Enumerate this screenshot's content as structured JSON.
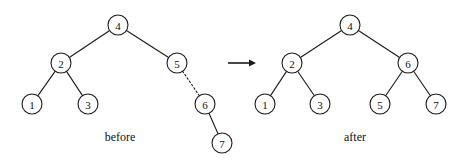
{
  "figure": {
    "background_color": "#ffffff",
    "stroke_color": "#1a1a1a",
    "node_fill": "#ffffff",
    "width": 467,
    "height": 163
  },
  "before": {
    "caption": "before",
    "caption_x": 120,
    "caption_y": 141,
    "nodes": [
      {
        "id": "b4",
        "label": "4",
        "x": 118,
        "y": 25,
        "r": 10
      },
      {
        "id": "b2",
        "label": "2",
        "x": 61,
        "y": 63,
        "r": 10
      },
      {
        "id": "b5",
        "label": "5",
        "x": 177,
        "y": 63,
        "r": 10
      },
      {
        "id": "b1",
        "label": "1",
        "x": 32,
        "y": 104,
        "r": 10
      },
      {
        "id": "b3",
        "label": "3",
        "x": 88,
        "y": 104,
        "r": 10
      },
      {
        "id": "b6",
        "label": "6",
        "x": 205,
        "y": 104,
        "r": 10
      },
      {
        "id": "b7",
        "label": "7",
        "x": 222,
        "y": 143,
        "r": 10
      }
    ],
    "edges": [
      {
        "from": "b4",
        "to": "b2",
        "style": "solid"
      },
      {
        "from": "b4",
        "to": "b5",
        "style": "solid"
      },
      {
        "from": "b2",
        "to": "b1",
        "style": "solid"
      },
      {
        "from": "b2",
        "to": "b3",
        "style": "solid"
      },
      {
        "from": "b5",
        "to": "b6",
        "style": "dotted"
      },
      {
        "from": "b6",
        "to": "b7",
        "style": "solid"
      }
    ]
  },
  "arrow": {
    "name": "transformation-arrow",
    "x1": 228,
    "y1": 63,
    "x2": 256,
    "y2": 63
  },
  "after": {
    "caption": "after",
    "caption_x": 355,
    "caption_y": 141,
    "nodes": [
      {
        "id": "a4",
        "label": "4",
        "x": 350,
        "y": 25,
        "r": 10
      },
      {
        "id": "a2",
        "label": "2",
        "x": 292,
        "y": 63,
        "r": 10
      },
      {
        "id": "a6",
        "label": "6",
        "x": 408,
        "y": 63,
        "r": 10
      },
      {
        "id": "a1",
        "label": "1",
        "x": 265,
        "y": 104,
        "r": 10
      },
      {
        "id": "a3",
        "label": "3",
        "x": 320,
        "y": 104,
        "r": 10
      },
      {
        "id": "a5",
        "label": "5",
        "x": 380,
        "y": 104,
        "r": 10
      },
      {
        "id": "a7",
        "label": "7",
        "x": 436,
        "y": 104,
        "r": 10
      }
    ],
    "edges": [
      {
        "from": "a4",
        "to": "a2",
        "style": "solid"
      },
      {
        "from": "a4",
        "to": "a6",
        "style": "solid"
      },
      {
        "from": "a2",
        "to": "a1",
        "style": "solid"
      },
      {
        "from": "a2",
        "to": "a3",
        "style": "solid"
      },
      {
        "from": "a6",
        "to": "a5",
        "style": "solid"
      },
      {
        "from": "a6",
        "to": "a7",
        "style": "solid"
      }
    ]
  }
}
